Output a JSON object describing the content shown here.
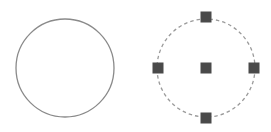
{
  "diagram": {
    "shapes": [
      {
        "id": "circle-plain",
        "type": "circle",
        "cx": 65,
        "cy": 68,
        "r": 49,
        "stroke": "#8a8a8a",
        "style": "solid",
        "selected": false
      },
      {
        "id": "circle-selected",
        "type": "circle",
        "cx": 206,
        "cy": 68,
        "r": 49,
        "stroke": "#9a9a9a",
        "style": "dashed",
        "selected": true,
        "grips": [
          {
            "name": "center",
            "x": 206,
            "y": 68
          },
          {
            "name": "top",
            "x": 206,
            "y": 17
          },
          {
            "name": "bottom",
            "x": 206,
            "y": 118
          },
          {
            "name": "left",
            "x": 158,
            "y": 68
          },
          {
            "name": "right",
            "x": 254,
            "y": 68
          }
        ],
        "grip_color": "#4a4a4a",
        "grip_size": 11
      }
    ]
  }
}
